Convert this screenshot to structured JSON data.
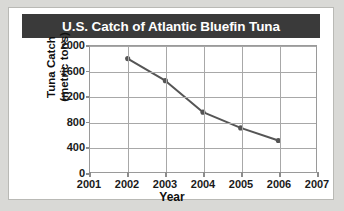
{
  "figure": {
    "title": "U.S. Catch of Atlantic Bluefin Tuna",
    "title_bar_color": "#3a3a3a",
    "background_color": "#ffffff",
    "page_background_color": "#d9d9d6",
    "grid_color": "#a8a8a8",
    "series_color": "#555555"
  },
  "chart_data": {
    "type": "line",
    "title": "U.S. Catch of Atlantic Bluefin Tuna",
    "xlabel": "Year",
    "ylabel": "Tuna Catch (metric tons)",
    "ylabel_line1": "Tuna Catch",
    "ylabel_line2": "(metric tons)",
    "x": [
      2002,
      2003,
      2004,
      2005,
      2006
    ],
    "values": [
      1800,
      1450,
      950,
      700,
      500
    ],
    "series": [
      {
        "name": "Tuna Catch",
        "color": "#555555",
        "points": [
          {
            "x": 2002,
            "y": 1800
          },
          {
            "x": 2003,
            "y": 1450
          },
          {
            "x": 2004,
            "y": 950
          },
          {
            "x": 2005,
            "y": 700
          },
          {
            "x": 2006,
            "y": 500
          }
        ]
      }
    ],
    "xlim": [
      2001,
      2007
    ],
    "ylim": [
      0,
      2000
    ],
    "xticks": [
      2001,
      2002,
      2003,
      2004,
      2005,
      2006,
      2007
    ],
    "xtick_labels": [
      "2001",
      "2002",
      "2003",
      "2004",
      "2005",
      "2006",
      "2007"
    ],
    "yticks": [
      0,
      400,
      800,
      1200,
      1600,
      2000
    ],
    "ytick_labels": [
      "0",
      "400",
      "800",
      "1200",
      "1600",
      "2000"
    ],
    "grid": true,
    "legend": false,
    "markers": true
  }
}
